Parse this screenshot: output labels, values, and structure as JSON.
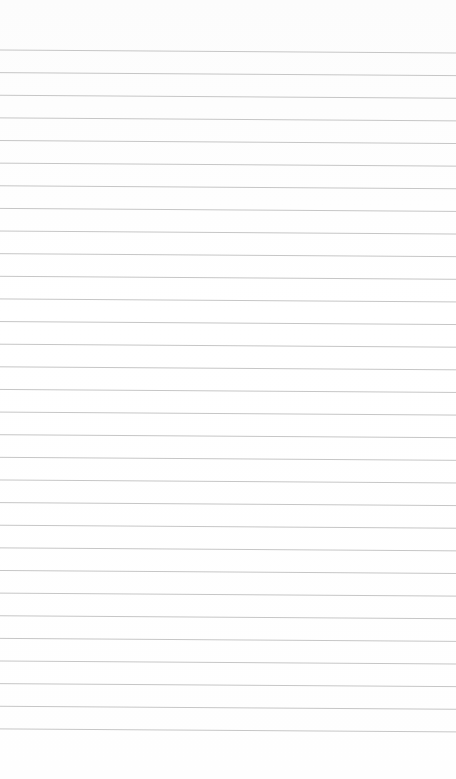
{
  "page": {
    "type": "blank lined notepad page",
    "background_color": "#fdfdfd",
    "line_color": "#c6c6c6",
    "line_count": 31,
    "first_line_y_left": 50,
    "first_line_y_right": 53,
    "line_spacing": 22.63,
    "line_width": 1
  }
}
